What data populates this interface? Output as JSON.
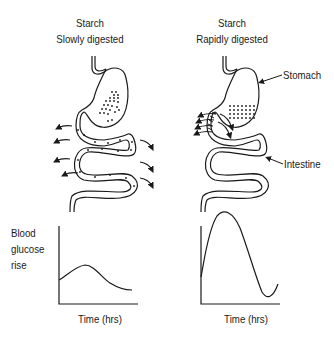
{
  "panels": [
    {
      "id": "slow",
      "title_line1": "Starch",
      "title_line2": "Slowly digested",
      "graph_xlabel": "Time (hrs)"
    },
    {
      "id": "rapid",
      "title_line1": "Starch",
      "title_line2": "Rapidly digested",
      "graph_xlabel": "Time (hrs)"
    }
  ],
  "annotations": {
    "stomach": "Stomach",
    "intestine": "Intestine"
  },
  "ylabel": {
    "line1": "Blood",
    "line2": "glucose",
    "line3": "rise"
  },
  "colors": {
    "line": "#1a1a1a",
    "background": "#ffffff"
  }
}
